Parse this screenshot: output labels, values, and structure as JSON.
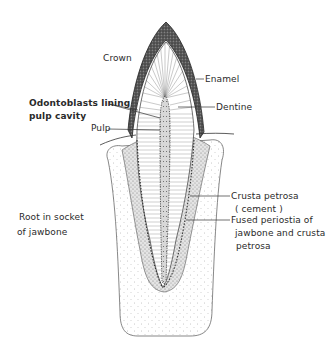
{
  "figure": {
    "colors": {
      "background": "#ffffff",
      "ink": "#2a2a2a",
      "enamel": "#4a4a4a",
      "stipple": "#9a9a9a"
    }
  },
  "labels": {
    "crown": "Crown",
    "enamel": "Enamel",
    "dentine": "Dentine",
    "odontoblasts_line1": "Odontoblasts lining",
    "odontoblasts_line2": "pulp cavity",
    "pulp": "Pulp",
    "crusta_line1": "Crusta petrosa",
    "crusta_line2": "( cement )",
    "fused_line1": "Fused periostia of",
    "fused_line2": "jawbone and crusta",
    "fused_line3": "petrosa",
    "root_line1": "Root in socket",
    "root_line2": "of jawbone"
  }
}
